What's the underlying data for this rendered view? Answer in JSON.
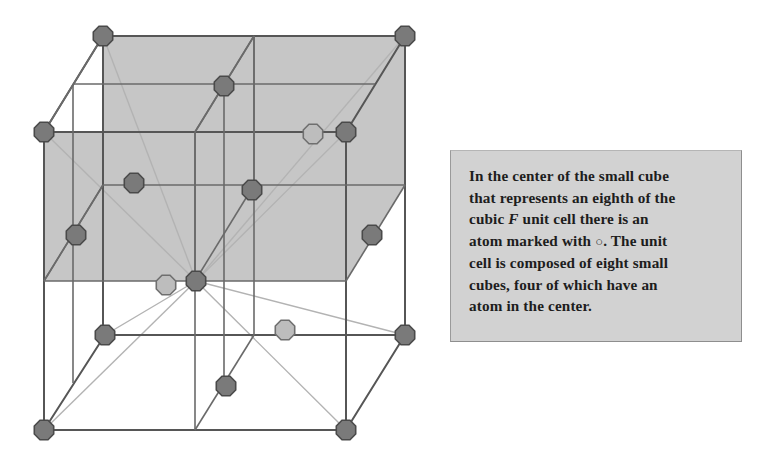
{
  "figure": {
    "colors": {
      "background": "#ffffff",
      "shaded_face": "#c6c6c6",
      "edge_dark": "#555555",
      "edge_light": "#b0b0b0",
      "atom_dark_fill": "#7a7a7a",
      "atom_dark_stroke": "#4a4a4a",
      "atom_light_fill": "#bdbdbd",
      "atom_light_stroke": "#6f6f6f",
      "caption_background": "#d2d2d2",
      "caption_text": "#1d1d1d"
    },
    "geometry": {
      "front_top_left": [
        44,
        132
      ],
      "front_top_right": [
        346,
        132
      ],
      "front_bottom_left": [
        44,
        430
      ],
      "front_bottom_right": [
        346,
        430
      ],
      "back_offset": [
        59,
        -96
      ],
      "cube_edge_px": 302
    },
    "atoms": [
      {
        "name": "corner-back-top-left",
        "x": 103,
        "y": 36,
        "shade": "dark"
      },
      {
        "name": "corner-back-top-right",
        "x": 405,
        "y": 36,
        "shade": "dark"
      },
      {
        "name": "edge-back-top-mid",
        "x": 224,
        "y": 86,
        "shade": "dark"
      },
      {
        "name": "corner-front-top-left",
        "x": 44,
        "y": 132,
        "shade": "dark"
      },
      {
        "name": "face-center-upper-right-a",
        "x": 313,
        "y": 134,
        "shade": "light"
      },
      {
        "name": "corner-front-top-right",
        "x": 346,
        "y": 132,
        "shade": "dark"
      },
      {
        "name": "face-center-left-upper",
        "x": 134,
        "y": 183,
        "shade": "dark"
      },
      {
        "name": "center-of-octant-right",
        "x": 252,
        "y": 190,
        "shade": "dark"
      },
      {
        "name": "edge-mid-left",
        "x": 76,
        "y": 235,
        "shade": "dark"
      },
      {
        "name": "edge-mid-right",
        "x": 372,
        "y": 235,
        "shade": "dark"
      },
      {
        "name": "octant-center-marked",
        "x": 166,
        "y": 285,
        "shade": "light"
      },
      {
        "name": "body-center",
        "x": 196,
        "y": 281,
        "shade": "dark"
      },
      {
        "name": "corner-back-bottom-left",
        "x": 105,
        "y": 335,
        "shade": "dark"
      },
      {
        "name": "face-center-front-lower",
        "x": 285,
        "y": 330,
        "shade": "light"
      },
      {
        "name": "corner-back-bottom-right",
        "x": 405,
        "y": 335,
        "shade": "dark"
      },
      {
        "name": "face-center-bottom",
        "x": 226,
        "y": 386,
        "shade": "dark"
      },
      {
        "name": "corner-front-bottom-left",
        "x": 44,
        "y": 430,
        "shade": "dark"
      },
      {
        "name": "corner-front-bottom-right",
        "x": 346,
        "y": 430,
        "shade": "dark"
      }
    ]
  },
  "caption": {
    "line1": "In the center of the small cube",
    "line2": "that represents an eighth of the",
    "line3_a": "cubic",
    "line3_italic": "F",
    "line3_b": "unit cell there is an",
    "line4_a": "atom marked with",
    "line4_symbol": "○",
    "line4_b": ". The unit",
    "line5": "cell is composed of eight small",
    "line6": "cubes, four of which have an",
    "line7": "atom in the center.",
    "full_text": "In the center of the small cube that represents an eighth of the cubic F unit cell there is an atom marked with ○. The unit cell is composed of eight small cubes, four of which have an atom in the center."
  }
}
